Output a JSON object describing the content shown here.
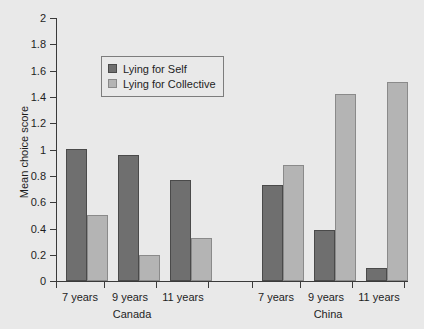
{
  "chart_data": {
    "type": "bar",
    "title": "",
    "xlabel": "",
    "ylabel": "Mean choice score",
    "ylim": [
      0,
      2
    ],
    "ytick_labels": [
      "0",
      "0.2",
      "0.4",
      "0.6",
      "0.8",
      "1",
      "1.2",
      "1.4",
      "1.6",
      "1.8",
      "2"
    ],
    "ytick_values": [
      0,
      0.2,
      0.4,
      0.6,
      0.8,
      1,
      1.2,
      1.4,
      1.6,
      1.8,
      2
    ],
    "grid": false,
    "legend_position": "upper-center-left",
    "categories": [
      "7 years",
      "9 years",
      "11 years",
      "7 years",
      "9 years",
      "11 years"
    ],
    "group_labels": [
      "Canada",
      "China"
    ],
    "groups": [
      {
        "name": "Canada",
        "ages": [
          "7 years",
          "9 years",
          "11 years"
        ],
        "lying_for_self": [
          1.0,
          0.96,
          0.77
        ],
        "lying_for_collective": [
          0.5,
          0.195,
          0.33
        ]
      },
      {
        "name": "China",
        "ages": [
          "7 years",
          "9 years",
          "11 years"
        ],
        "lying_for_self": [
          0.73,
          0.39,
          0.1
        ],
        "lying_for_collective": [
          0.88,
          1.42,
          1.51
        ]
      }
    ],
    "series": [
      {
        "name": "Lying for Self",
        "color": "#6f6f6f",
        "values": [
          1.0,
          0.96,
          0.77,
          0.73,
          0.39,
          0.1
        ]
      },
      {
        "name": "Lying for Collective",
        "color": "#b4b4b4",
        "values": [
          0.5,
          0.195,
          0.33,
          0.88,
          1.42,
          1.51
        ]
      }
    ]
  },
  "legend": {
    "items": [
      {
        "label": "Lying for Self",
        "color": "#6f6f6f"
      },
      {
        "label": "Lying for Collective",
        "color": "#b4b4b4"
      }
    ]
  },
  "axes": {
    "y_axis_label": "Mean choice score"
  },
  "colors": {
    "background": "#e9e9e9",
    "axis": "#3a3a3a",
    "series_self": "#6f6f6f",
    "series_collective": "#b4b4b4",
    "text": "#1e1e1e"
  }
}
